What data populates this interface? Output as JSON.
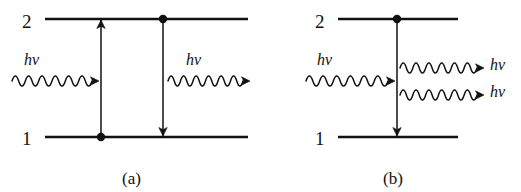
{
  "figure": {
    "background_color": "#ffffff",
    "ink_color": "#111111",
    "panels": [
      {
        "id": "a",
        "caption": "(a)",
        "caption_x": 122,
        "caption_y": 170,
        "levels": [
          {
            "name": "upper-level",
            "label": "2",
            "label_x": 22,
            "label_y": 12,
            "y": 19,
            "x1": 45,
            "x2": 248
          },
          {
            "name": "lower-level",
            "label": "1",
            "label_x": 22,
            "label_y": 129,
            "y": 137,
            "x1": 45,
            "x2": 248
          }
        ],
        "transitions": [
          {
            "name": "absorption-arrow",
            "direction": "up",
            "x": 101,
            "y_from": 137,
            "y_to": 19
          },
          {
            "name": "emission-arrow",
            "direction": "down",
            "x": 163,
            "y_from": 19,
            "y_to": 137
          }
        ],
        "electrons": [
          {
            "name": "electron-dot-lower",
            "x": 101,
            "y": 137
          },
          {
            "name": "electron-dot-upper",
            "x": 163,
            "y": 19
          }
        ],
        "photons": [
          {
            "name": "incoming-photon",
            "label": "hν",
            "label_x": 24,
            "label_y": 52,
            "wave_x1": 12,
            "wave_x2": 99,
            "wave_y": 81,
            "cycles": 6,
            "amplitude": 5,
            "arrow": "right"
          },
          {
            "name": "outgoing-photon",
            "label": "hν",
            "label_x": 186,
            "label_y": 52,
            "wave_x1": 168,
            "wave_x2": 250,
            "wave_y": 81,
            "cycles": 6,
            "amplitude": 5,
            "arrow": "right"
          }
        ]
      },
      {
        "id": "b",
        "caption": "(b)",
        "caption_x": 383,
        "caption_y": 170,
        "levels": [
          {
            "name": "upper-level",
            "label": "2",
            "label_x": 315,
            "label_y": 12,
            "y": 19,
            "x1": 338,
            "x2": 458
          },
          {
            "name": "lower-level",
            "label": "1",
            "label_x": 315,
            "label_y": 129,
            "y": 137,
            "x1": 338,
            "x2": 458
          }
        ],
        "transitions": [
          {
            "name": "stimulated-emission-arrow",
            "direction": "down",
            "x": 397,
            "y_from": 19,
            "y_to": 137
          }
        ],
        "electrons": [
          {
            "name": "electron-dot-upper",
            "x": 397,
            "y": 19
          }
        ],
        "photons": [
          {
            "name": "incoming-photon",
            "label": "hν",
            "label_x": 317,
            "label_y": 52,
            "wave_x1": 306,
            "wave_x2": 395,
            "wave_y": 81,
            "cycles": 6,
            "amplitude": 5,
            "arrow": "right"
          },
          {
            "name": "outgoing-photon-1",
            "label": "hν",
            "label_x": 490,
            "label_y": 57,
            "wave_x1": 400,
            "wave_x2": 484,
            "wave_y": 68,
            "cycles": 6,
            "amplitude": 5,
            "arrow": "right"
          },
          {
            "name": "outgoing-photon-2",
            "label": "hν",
            "label_x": 490,
            "label_y": 84,
            "wave_x1": 400,
            "wave_x2": 484,
            "wave_y": 95,
            "cycles": 6,
            "amplitude": 5,
            "arrow": "right"
          }
        ]
      }
    ]
  }
}
